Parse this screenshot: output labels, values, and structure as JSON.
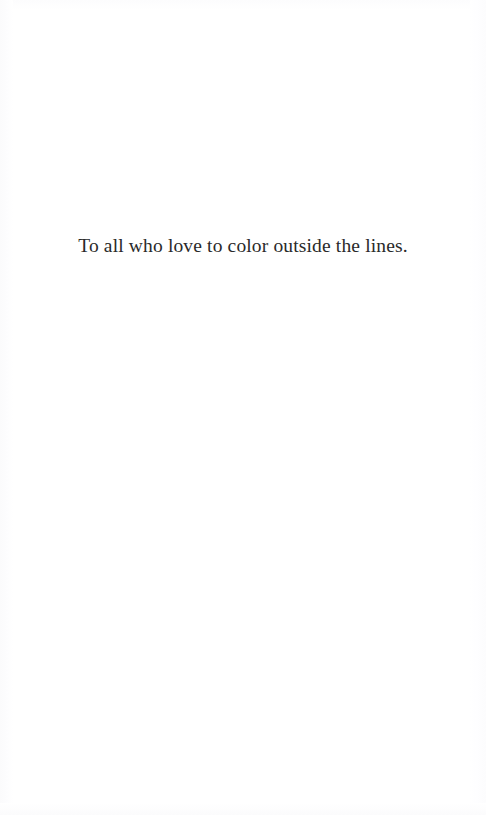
{
  "page": {
    "kind": "book-dedication-page",
    "background_color": "#ffffff",
    "width": 486,
    "height": 815
  },
  "dedication": {
    "text": "To all who love to color outside the lines.",
    "text_color": "#2a2a2a",
    "alignment": "center"
  }
}
